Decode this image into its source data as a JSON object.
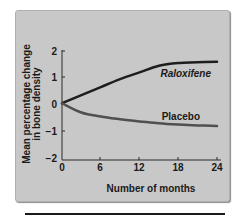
{
  "chart_data": {
    "type": "line",
    "title": "",
    "xlabel": "Number of months",
    "ylabel": "Mean percentage change in bone density",
    "ylabel_lines": [
      "Mean percentage change",
      "in bone density"
    ],
    "x_ticks": [
      0,
      6,
      12,
      18,
      24
    ],
    "y_ticks": [
      2,
      1,
      0,
      -1,
      -2
    ],
    "y_tick_labels": [
      "2",
      "1",
      "0",
      "−1",
      "−2"
    ],
    "xlim": [
      0,
      24
    ],
    "ylim": [
      -2,
      2
    ],
    "grid": false,
    "legend": "inline labels",
    "series": [
      {
        "name": "Raloxifene",
        "label": "Raloxifene",
        "color": "#1e1e1e",
        "x": [
          0,
          3,
          6,
          9,
          12,
          15,
          18,
          21,
          24
        ],
        "values": [
          0.05,
          0.35,
          0.65,
          0.95,
          1.2,
          1.45,
          1.55,
          1.58,
          1.6
        ]
      },
      {
        "name": "Placebo",
        "label": "Placebo",
        "color": "#505050",
        "x": [
          0,
          3,
          6,
          9,
          12,
          15,
          18,
          21,
          24
        ],
        "values": [
          0.05,
          -0.3,
          -0.45,
          -0.55,
          -0.63,
          -0.7,
          -0.75,
          -0.78,
          -0.8
        ]
      }
    ]
  },
  "colors": {
    "panel_background": "#c8c8c8",
    "axis": "#2a2a2a",
    "text": "#1a1a1a"
  }
}
